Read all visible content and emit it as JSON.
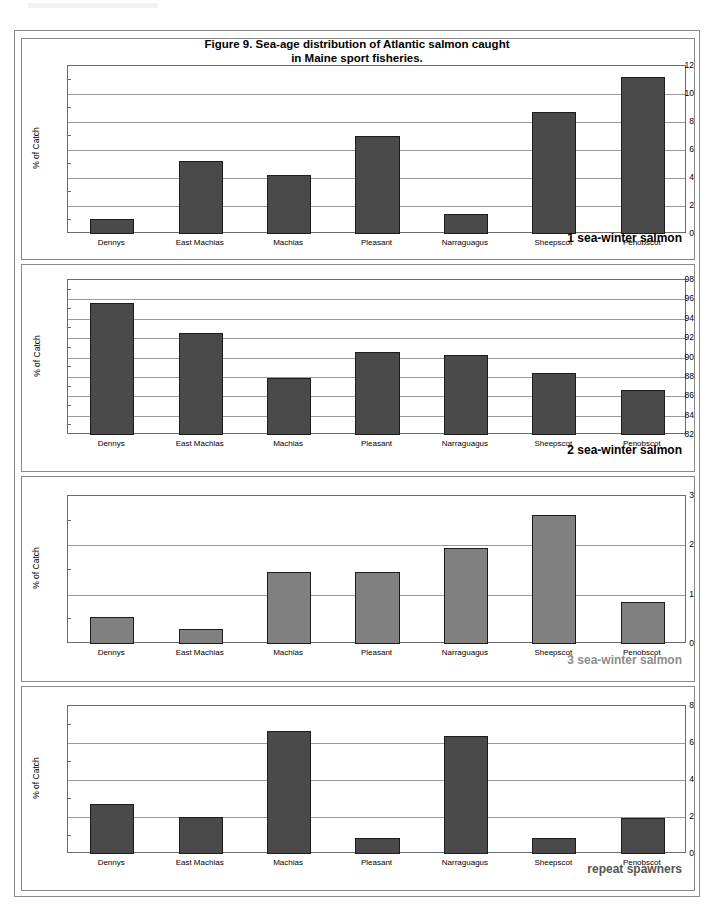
{
  "figure": {
    "title_line1": "Figure 9. Sea-age distribution of Atlantic salmon caught",
    "title_line2": "in Maine sport fisheries.",
    "y_axis_title": "% of Catch",
    "categories": [
      "Dennys",
      "East Machias",
      "Machias",
      "Pleasant",
      "Narraguagus",
      "Sheepscot",
      "Penobscot"
    ],
    "colors": {
      "bar_dark": "#4a4a4a",
      "bar_light": "#808080",
      "bar_outline": "#1d1d1d",
      "gridline": "#9a9a9a",
      "axis": "#6b6b6b",
      "frame": "#8a8a8a",
      "caption_dark": "#000000",
      "caption_light": "#8c8c8c"
    }
  },
  "chart_data": [
    {
      "type": "bar",
      "title": "1 sea-winter salmon",
      "caption": "1 sea-winter salmon",
      "caption_color": "#000000",
      "bar_color": "#4a4a4a",
      "xlabel": "",
      "ylabel": "% of Catch",
      "ylim": [
        0,
        12
      ],
      "ytick_step": 2,
      "yticks": [
        0,
        2,
        4,
        6,
        8,
        10,
        12
      ],
      "grid": true,
      "legend": "none",
      "categories": [
        "Dennys",
        "East Machias",
        "Machias",
        "Pleasant",
        "Narraguagus",
        "Sheepscot",
        "Penobscot"
      ],
      "values": [
        1.05,
        5.2,
        4.2,
        7.0,
        1.45,
        8.75,
        11.25
      ]
    },
    {
      "type": "bar",
      "title": "2 sea-winter salmon",
      "caption": "2 sea-winter salmon",
      "caption_color": "#000000",
      "bar_color": "#4a4a4a",
      "xlabel": "",
      "ylabel": "% of Catch",
      "ylim": [
        82,
        98
      ],
      "ytick_step": 2,
      "yticks": [
        82,
        84,
        86,
        88,
        90,
        92,
        94,
        96,
        98
      ],
      "grid": true,
      "legend": "none",
      "categories": [
        "Dennys",
        "East Machias",
        "Machias",
        "Pleasant",
        "Narraguagus",
        "Sheepscot",
        "Penobscot"
      ],
      "values": [
        95.6,
        92.5,
        87.9,
        90.6,
        90.3,
        88.4,
        86.6
      ]
    },
    {
      "type": "bar",
      "title": "3 sea-winter salmon",
      "caption": "3 sea-winter salmon",
      "caption_color": "#8c8c8c",
      "bar_color": "#808080",
      "xlabel": "",
      "ylabel": "% of Catch",
      "ylim": [
        0,
        3
      ],
      "ytick_step": 1,
      "yticks": [
        0,
        1,
        2,
        3
      ],
      "grid": true,
      "legend": "none",
      "categories": [
        "Dennys",
        "East Machias",
        "Machias",
        "Pleasant",
        "Narraguagus",
        "Sheepscot",
        "Penobscot"
      ],
      "values": [
        0.55,
        0.3,
        1.45,
        1.45,
        1.95,
        2.62,
        0.85
      ]
    },
    {
      "type": "bar",
      "title": "repeat spawners",
      "caption": "repeat spawners",
      "caption_color": "#555555",
      "bar_color": "#4a4a4a",
      "xlabel": "",
      "ylabel": "% of Catch",
      "ylim": [
        0,
        8
      ],
      "ytick_step": 2,
      "yticks": [
        0,
        2,
        4,
        6,
        8
      ],
      "grid": true,
      "legend": "none",
      "categories": [
        "Dennys",
        "East Machias",
        "Machias",
        "Pleasant",
        "Narraguagus",
        "Sheepscot",
        "Penobscot"
      ],
      "values": [
        2.72,
        2.02,
        6.65,
        0.85,
        6.4,
        0.85,
        1.92
      ]
    }
  ]
}
